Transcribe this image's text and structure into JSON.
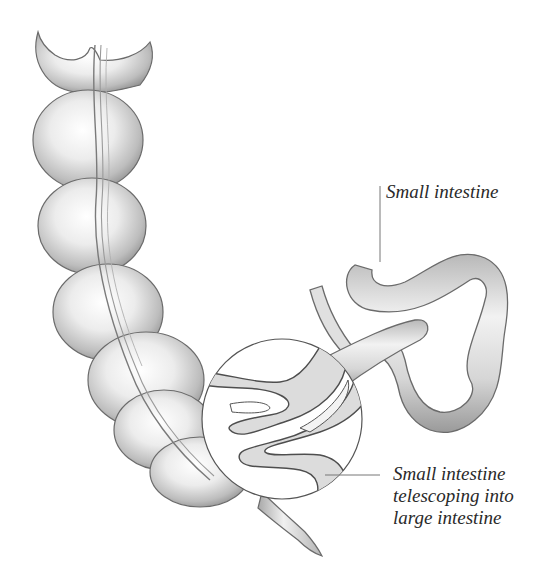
{
  "diagram": {
    "labels": {
      "small_intestine": "Small intestine",
      "telescoping": {
        "line1": "Small intestine",
        "line2": "telescoping into",
        "line3": "large intestine"
      }
    },
    "parts": [
      "large-intestine",
      "small-intestine",
      "magnified-cutaway-circle",
      "telescoped-segment",
      "appendix"
    ],
    "colors": {
      "background": "#ffffff",
      "ink": "#3a3a3a",
      "shade_dark": "#8c8c8c",
      "shade_mid": "#c4c4c4",
      "shade_light": "#e6e6e6",
      "label_text": "#2a2a2a",
      "leader_line": "#777777"
    }
  }
}
